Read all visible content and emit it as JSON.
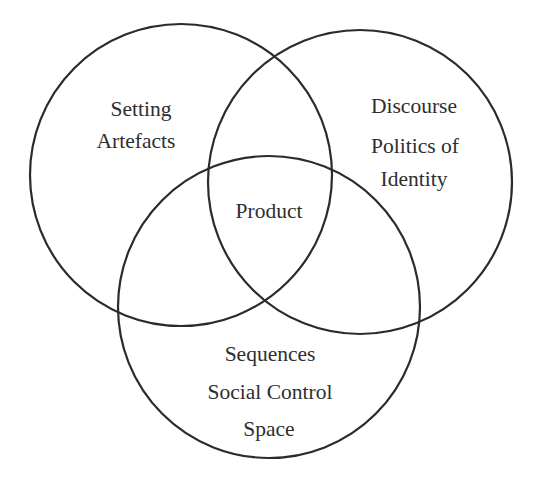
{
  "diagram": {
    "type": "venn",
    "colors": {
      "stroke": "#2b2b2b",
      "text": "#2e2e2e",
      "background": "#ffffff"
    },
    "circles": [
      {
        "id": "top-left",
        "cx": 181,
        "cy": 175,
        "r": 151,
        "labels": [
          "Setting",
          "Artefacts"
        ]
      },
      {
        "id": "top-right",
        "cx": 360,
        "cy": 182,
        "r": 152,
        "labels": [
          "Discourse",
          "Politics of",
          "Identity"
        ]
      },
      {
        "id": "bottom",
        "cx": 269,
        "cy": 307,
        "r": 151,
        "labels": [
          "Sequences",
          "Social Control",
          "Space"
        ]
      }
    ],
    "intersection": {
      "label": "Product"
    }
  }
}
